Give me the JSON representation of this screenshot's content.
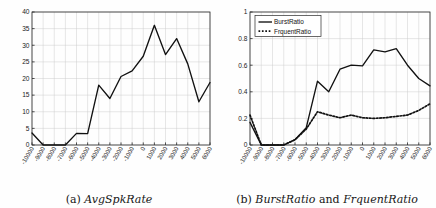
{
  "figure": {
    "panels": [
      {
        "id": "panel-a",
        "caption_prefix": "(a) ",
        "caption_title": "AvgSpkRate"
      },
      {
        "id": "panel-b",
        "caption_prefix": "(b) ",
        "caption_title": "BurstRatio",
        "caption_conj": " and ",
        "caption_title2": "FrquentRatio"
      }
    ]
  },
  "chart_data": [
    {
      "type": "line",
      "title": "AvgSpkRate",
      "xlabel": "",
      "ylabel": "",
      "grid": true,
      "legend": null,
      "x": [
        -10000,
        -9000,
        -8000,
        -7000,
        -6000,
        -5000,
        -4000,
        -3000,
        -2000,
        -1000,
        0,
        1000,
        2000,
        3000,
        4000,
        5000,
        6000
      ],
      "xtick_labels": [
        "-10000",
        "-9000",
        "-8000",
        "-7000",
        "-6000",
        "-5000",
        "-4000",
        "-3000",
        "-2000",
        "-1000",
        "0",
        "1000",
        "2000",
        "3000",
        "4000",
        "5000",
        "6000"
      ],
      "ylim": [
        0,
        40
      ],
      "ytick_labels": [
        "0",
        "5",
        "10",
        "15",
        "20",
        "25",
        "30",
        "35",
        "40"
      ],
      "ytick_values": [
        0,
        5,
        10,
        15,
        20,
        25,
        30,
        35,
        40
      ],
      "series": [
        {
          "name": "AvgSpkRate",
          "style": "solid",
          "color": "#111111",
          "values": [
            3.6,
            0,
            0,
            0,
            3.5,
            3.4,
            18,
            14,
            20.6,
            22.3,
            26.7,
            36,
            27.2,
            32,
            24.4,
            13,
            18.8
          ]
        }
      ]
    },
    {
      "type": "line",
      "title": "BurstRatio and FrquentRatio",
      "xlabel": "",
      "ylabel": "",
      "grid": true,
      "legend": "upper-left",
      "x": [
        -10000,
        -9000,
        -8000,
        -7000,
        -6000,
        -5000,
        -4000,
        -3000,
        -2000,
        -1000,
        0,
        1000,
        2000,
        3000,
        4000,
        5000,
        6000
      ],
      "xtick_labels": [
        "-10000",
        "-9000",
        "-8000",
        "-7000",
        "-6000",
        "-5000",
        "-4000",
        "-3000",
        "-2000",
        "-1000",
        "0",
        "1000",
        "2000",
        "3000",
        "4000",
        "5000",
        "6000"
      ],
      "ylim": [
        0,
        1
      ],
      "ytick_labels": [
        "0",
        "0.2",
        "0.4",
        "0.6",
        "0.8",
        "1"
      ],
      "ytick_values": [
        0,
        0.2,
        0.4,
        0.6,
        0.8,
        1
      ],
      "series": [
        {
          "name": "BurstRatio",
          "style": "solid",
          "color": "#111111",
          "values": [
            0.17,
            0,
            0,
            0,
            0.04,
            0.13,
            0.48,
            0.4,
            0.57,
            0.6,
            0.595,
            0.715,
            0.7,
            0.725,
            0.6,
            0.5,
            0.445
          ]
        },
        {
          "name": "FrquentRatio",
          "style": "dotted",
          "color": "#111111",
          "values": [
            0.225,
            0,
            0,
            0,
            0.04,
            0.12,
            0.25,
            0.225,
            0.205,
            0.225,
            0.205,
            0.2,
            0.205,
            0.215,
            0.225,
            0.26,
            0.31
          ]
        }
      ]
    }
  ]
}
